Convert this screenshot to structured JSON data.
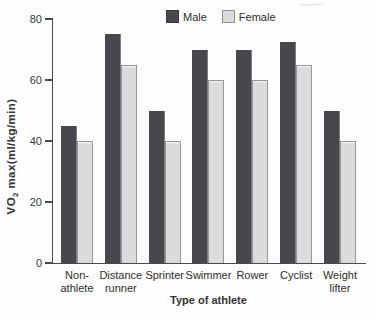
{
  "figure": {
    "background": "#fdfdfd",
    "axis_color": "#4a4a4a"
  },
  "chart_data": {
    "type": "bar",
    "title": "",
    "categories": [
      "Non-\nathlete",
      "Distance\nrunner",
      "Sprinter",
      "Swimmer",
      "Rower",
      "Cyclist",
      "Weight\nlifter"
    ],
    "series": [
      {
        "name": "Male",
        "color": "#47474d",
        "values": [
          45,
          75,
          50,
          70,
          70,
          72.5,
          50
        ]
      },
      {
        "name": "Female",
        "color": "#dbdbdb",
        "values": [
          40,
          65,
          40,
          60,
          60,
          65,
          40
        ]
      }
    ],
    "xlabel": "Type of athlete",
    "ylabel": "VO2 max(ml/kg/min)",
    "ylabel_parts": {
      "pre": "VO",
      "sub": "2",
      "post": " max(ml/kg/min)"
    },
    "ylim": [
      0,
      80
    ],
    "yticks": [
      0,
      20,
      40,
      60,
      80
    ],
    "grid": false,
    "legend_position": "top-center"
  }
}
